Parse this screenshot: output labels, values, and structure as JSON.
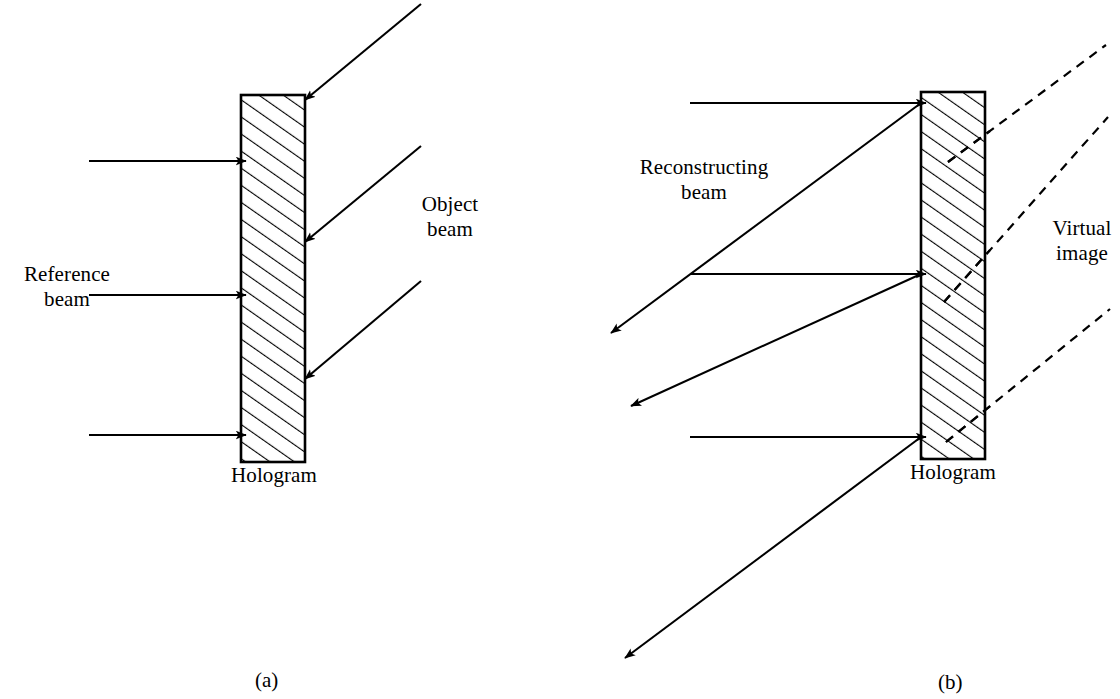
{
  "figure": {
    "width": 1120,
    "height": 699,
    "background": "#ffffff",
    "ink_color": "#000000"
  },
  "panel_a": {
    "caption": "(a)",
    "description": "Recording a hologram: reference beam and object beam interfere at the photographic plate",
    "hologram_label": "Hologram",
    "reference_beam_label": "Reference\nbeam",
    "object_beam_label": "Object\nbeam",
    "plate": {
      "x": 241,
      "y": 95,
      "width": 64,
      "height": 367,
      "hatch": "diagonal-45-up",
      "stroke": "#000000",
      "stroke_width": 2.6
    },
    "reference_rays": [
      {
        "x1": 89,
        "y1": 161,
        "x2": 239,
        "y2": 161
      },
      {
        "x1": 89,
        "y1": 295,
        "x2": 239,
        "y2": 295
      },
      {
        "x1": 89,
        "y1": 435,
        "x2": 239,
        "y2": 435
      }
    ],
    "object_rays": [
      {
        "x1": 420,
        "y1": 4,
        "x2": 309,
        "y2": 96
      },
      {
        "x1": 420,
        "y1": 146,
        "x2": 309,
        "y2": 238
      },
      {
        "x1": 420,
        "y1": 281,
        "x2": 309,
        "y2": 375
      }
    ]
  },
  "panel_b": {
    "caption": "(b)",
    "description": "Reconstruction: reconstructing beam illuminates the hologram producing a virtual image",
    "hologram_label": "Hologram",
    "reconstructing_beam_label": "Reconstructing\nbeam",
    "virtual_image_label": "Virtual\nimage",
    "plate": {
      "x": 921,
      "y": 92,
      "width": 64,
      "height": 367,
      "hatch": "diagonal-45-up",
      "stroke": "#000000",
      "stroke_width": 2.6
    },
    "reconstructing_rays": [
      {
        "x1": 690,
        "y1": 103,
        "x2": 919,
        "y2": 103
      },
      {
        "x1": 690,
        "y1": 274,
        "x2": 919,
        "y2": 274
      },
      {
        "x1": 690,
        "y1": 437,
        "x2": 919,
        "y2": 437
      }
    ],
    "diffracted_rays": [
      {
        "x1": 921,
        "y1": 103,
        "x2": 612,
        "y2": 330
      },
      {
        "x1": 921,
        "y1": 274,
        "x2": 633,
        "y2": 403
      },
      {
        "x1": 921,
        "y1": 437,
        "x2": 627,
        "y2": 655
      }
    ],
    "virtual_image_rays": [
      {
        "x1": 950,
        "y1": 160,
        "x2": 1104,
        "y2": 46
      },
      {
        "x1": 945,
        "y1": 300,
        "x2": 1106,
        "y2": 118
      },
      {
        "x1": 948,
        "y1": 440,
        "x2": 1108,
        "y2": 310
      }
    ]
  }
}
